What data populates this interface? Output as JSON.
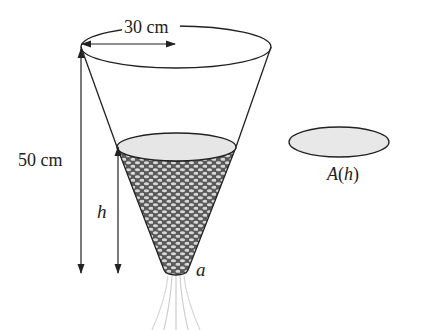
{
  "diagram": {
    "labels": {
      "top_radius": "30 cm",
      "total_height": "50 cm",
      "water_height": "h",
      "hole": "a",
      "area_func_name": "A",
      "area_func_arg": "h",
      "area_func": "A(h)"
    },
    "colors": {
      "stroke": "#222222",
      "water_surface": "#e6e6e6",
      "water_fill": "#5a5a5a",
      "water_bubble": "#d8d8d8",
      "cross_section": "#e8e8e8",
      "stream": "#cfcfcf"
    }
  }
}
